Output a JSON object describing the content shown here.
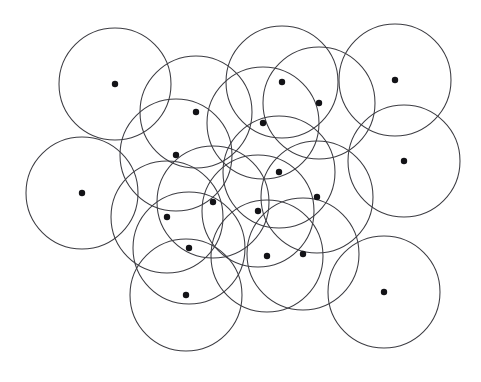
{
  "figure": {
    "type": "geometric-diagram",
    "canvas": {
      "width": 481,
      "height": 382
    },
    "background_color": "#ffffff",
    "circle_stroke_color": "#3c3c42",
    "circle_stroke_width": 1.05,
    "dot_color": "#131317",
    "dot_radius": 3.2,
    "circle_radius": 56,
    "circle_count": 19,
    "dot_count": 19,
    "circles": [
      {
        "id": "disk-01",
        "cx": 115,
        "cy": 84,
        "r": 56
      },
      {
        "id": "disk-02",
        "cx": 196,
        "cy": 112,
        "r": 56
      },
      {
        "id": "disk-03",
        "cx": 282,
        "cy": 82,
        "r": 56
      },
      {
        "id": "disk-04",
        "cx": 319,
        "cy": 103,
        "r": 56
      },
      {
        "id": "disk-05",
        "cx": 395,
        "cy": 80,
        "r": 56
      },
      {
        "id": "disk-06",
        "cx": 263,
        "cy": 123,
        "r": 56
      },
      {
        "id": "disk-07",
        "cx": 82,
        "cy": 193,
        "r": 56
      },
      {
        "id": "disk-08",
        "cx": 176,
        "cy": 155,
        "r": 56
      },
      {
        "id": "disk-09",
        "cx": 279,
        "cy": 172,
        "r": 56
      },
      {
        "id": "disk-10",
        "cx": 404,
        "cy": 161,
        "r": 56
      },
      {
        "id": "disk-11",
        "cx": 213,
        "cy": 202,
        "r": 56
      },
      {
        "id": "disk-12",
        "cx": 317,
        "cy": 197,
        "r": 56
      },
      {
        "id": "disk-13",
        "cx": 167,
        "cy": 217,
        "r": 56
      },
      {
        "id": "disk-14",
        "cx": 258,
        "cy": 211,
        "r": 56
      },
      {
        "id": "disk-15",
        "cx": 189,
        "cy": 248,
        "r": 56
      },
      {
        "id": "disk-16",
        "cx": 267,
        "cy": 256,
        "r": 56
      },
      {
        "id": "disk-17",
        "cx": 303,
        "cy": 254,
        "r": 56
      },
      {
        "id": "disk-18",
        "cx": 186,
        "cy": 295,
        "r": 56
      },
      {
        "id": "disk-19",
        "cx": 384,
        "cy": 292,
        "r": 56
      }
    ],
    "centers": [
      {
        "id": "pt-01",
        "x": 115,
        "y": 84
      },
      {
        "id": "pt-02",
        "x": 196,
        "y": 112
      },
      {
        "id": "pt-03",
        "x": 282,
        "y": 82
      },
      {
        "id": "pt-04",
        "x": 319,
        "y": 103
      },
      {
        "id": "pt-05",
        "x": 395,
        "y": 80
      },
      {
        "id": "pt-06",
        "x": 263,
        "y": 123
      },
      {
        "id": "pt-07",
        "x": 82,
        "y": 193
      },
      {
        "id": "pt-08",
        "x": 176,
        "y": 155
      },
      {
        "id": "pt-09",
        "x": 279,
        "y": 172
      },
      {
        "id": "pt-10",
        "x": 404,
        "y": 161
      },
      {
        "id": "pt-11",
        "x": 213,
        "y": 202
      },
      {
        "id": "pt-12",
        "x": 317,
        "y": 197
      },
      {
        "id": "pt-13",
        "x": 167,
        "y": 217
      },
      {
        "id": "pt-14",
        "x": 258,
        "y": 211
      },
      {
        "id": "pt-15",
        "x": 189,
        "y": 248
      },
      {
        "id": "pt-16",
        "x": 267,
        "y": 256
      },
      {
        "id": "pt-17",
        "x": 303,
        "y": 254
      },
      {
        "id": "pt-18",
        "x": 186,
        "y": 295
      },
      {
        "id": "pt-19",
        "x": 384,
        "y": 292
      }
    ],
    "ghost_text": [
      {
        "text": "ITIT ITIT ITI TT",
        "x": 40,
        "y": 40
      },
      {
        "text": "TI  T TITI",
        "x": 215,
        "y": 38
      },
      {
        "text": "TI  IT TI",
        "x": 360,
        "y": 42
      },
      {
        "text": "TTI  T",
        "x": 395,
        "y": 70
      },
      {
        "text": "T TT",
        "x": 30,
        "y": 250
      },
      {
        "text": "TI  T TI  IT",
        "x": 60,
        "y": 265
      },
      {
        "text": "IT TTI  TI",
        "x": 90,
        "y": 300
      },
      {
        "text": "TI TT  II  TI",
        "x": 60,
        "y": 325
      },
      {
        "text": "TITI  TI",
        "x": 180,
        "y": 360
      },
      {
        "text": "T TITI",
        "x": 300,
        "y": 345
      },
      {
        "text": "IT TI",
        "x": 400,
        "y": 300
      }
    ]
  }
}
